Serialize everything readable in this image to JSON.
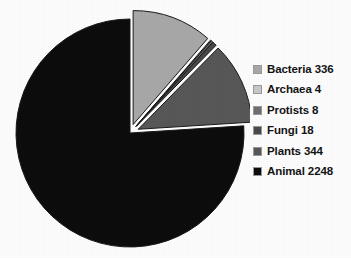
{
  "chart_data": {
    "type": "pie",
    "title": "",
    "subtitle": "",
    "xlabel": "",
    "ylabel": "",
    "grid": false,
    "legend_position": "right",
    "total": 2958,
    "units": "species count (thousands)",
    "start_angle_deg": 0,
    "direction": "clockwise",
    "exploded_slices": [
      "Bacteria",
      "Archaea",
      "Protists",
      "Fungi",
      "Plants"
    ],
    "categories": [
      "Bacteria",
      "Archaea",
      "Protists",
      "Fungi",
      "Plants",
      "Animal"
    ],
    "values": [
      336,
      4,
      8,
      18,
      344,
      2248
    ],
    "colors": [
      "#a8a8a8",
      "#c9c9c9",
      "#6f6f6f",
      "#4a4a4a",
      "#585858",
      "#0d0d0d"
    ],
    "slices": [
      {
        "label": "Bacteria",
        "value": 336,
        "color": "#a8a8a8",
        "percent": 11.36,
        "angle_deg": 40.9,
        "exploded": true
      },
      {
        "label": "Archaea",
        "value": 4,
        "color": "#c9c9c9",
        "percent": 0.14,
        "angle_deg": 0.49,
        "exploded": true
      },
      {
        "label": "Protists",
        "value": 8,
        "color": "#6f6f6f",
        "percent": 0.27,
        "angle_deg": 0.97,
        "exploded": true
      },
      {
        "label": "Fungi",
        "value": 18,
        "color": "#4a4a4a",
        "percent": 0.61,
        "angle_deg": 2.19,
        "exploded": true
      },
      {
        "label": "Plants",
        "value": 344,
        "color": "#585858",
        "percent": 11.63,
        "angle_deg": 41.87,
        "exploded": true
      },
      {
        "label": "Animal",
        "value": 2248,
        "color": "#0d0d0d",
        "percent": 76.0,
        "angle_deg": 273.6,
        "exploded": false
      }
    ]
  },
  "legend": {
    "items": [
      {
        "label": "Bacteria 336",
        "swatch": "#a8a8a8"
      },
      {
        "label": "Archaea 4",
        "swatch": "#c9c9c9"
      },
      {
        "label": "Protists 8",
        "swatch": "#6f6f6f"
      },
      {
        "label": "Fungi 18",
        "swatch": "#4a4a4a"
      },
      {
        "label": "Plants 344",
        "swatch": "#585858"
      },
      {
        "label": "Animal 2248",
        "swatch": "#0d0d0d"
      }
    ]
  }
}
